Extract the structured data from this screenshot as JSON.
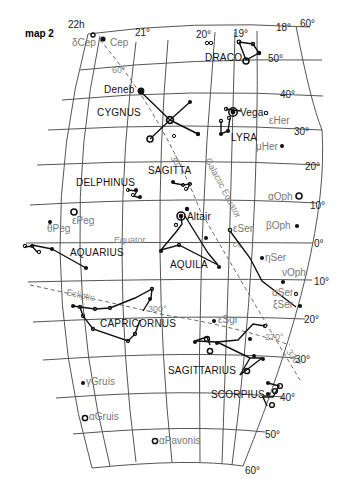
{
  "title": "map 2",
  "ra_labels": [
    {
      "text": "22h",
      "x": 64,
      "y": 32,
      "rot": -8
    },
    {
      "text": "21°",
      "x": 135,
      "y": 36,
      "rot": 0
    },
    {
      "text": "20°",
      "x": 198,
      "y": 38,
      "rot": 0
    },
    {
      "text": "19°",
      "x": 243,
      "y": 36,
      "rot": 0
    },
    {
      "text": "18°",
      "x": 283,
      "y": 30,
      "rot": 0
    },
    {
      "text": "60°",
      "x": 320,
      "y": 28,
      "rot": -20
    }
  ],
  "dec_labels": [
    {
      "text": "50°",
      "x": 325,
      "y": 62
    },
    {
      "text": "40°",
      "x": 321,
      "y": 98
    },
    {
      "text": "30°",
      "x": 318,
      "y": 135
    },
    {
      "text": "20°",
      "x": 312,
      "y": 170
    },
    {
      "text": "10°",
      "x": 310,
      "y": 209
    },
    {
      "text": "0°",
      "x": 313,
      "y": 247
    },
    {
      "text": "10°",
      "x": 313,
      "y": 285
    },
    {
      "text": "20°",
      "x": 304,
      "y": 323
    },
    {
      "text": "30°",
      "x": 295,
      "y": 364
    },
    {
      "text": "40°",
      "x": 283,
      "y": 402
    },
    {
      "text": "50°",
      "x": 265,
      "y": 438
    },
    {
      "text": "60°",
      "x": 242,
      "y": 472
    }
  ],
  "constellations": [
    {
      "name": "DRACO",
      "x": 205,
      "y": 61
    },
    {
      "name": "CYGNUS",
      "x": 97,
      "y": 116
    },
    {
      "name": "LYRA",
      "x": 231,
      "y": 141
    },
    {
      "name": "SAGITTA",
      "x": 152,
      "y": 174
    },
    {
      "name": "DELPHINUS",
      "x": 76,
      "y": 186
    },
    {
      "name": "AQUARIUS",
      "x": 40,
      "y": 255
    },
    {
      "name": "AQUILA",
      "x": 178,
      "y": 268
    },
    {
      "name": "CAPRICORNUS",
      "x": 99,
      "y": 327
    },
    {
      "name": "SAGITTARIUS",
      "x": 175,
      "y": 374
    },
    {
      "name": "SCORPIUS",
      "x": 211,
      "y": 398
    }
  ],
  "named_stars": [
    {
      "name": "δCep",
      "x": 72,
      "y": 46
    },
    {
      "name": "Cep",
      "x": 110,
      "y": 46
    },
    {
      "name": "Deneb",
      "x": 106,
      "y": 94
    },
    {
      "name": "Vega",
      "x": 237,
      "y": 113
    },
    {
      "name": "εHer",
      "x": 275,
      "y": 123
    },
    {
      "name": "μHer",
      "x": 253,
      "y": 151
    },
    {
      "name": "Altair",
      "x": 184,
      "y": 221
    },
    {
      "name": "εPeg",
      "x": 72,
      "y": 224
    },
    {
      "name": "θPeg",
      "x": 45,
      "y": 232
    },
    {
      "name": "αOph",
      "x": 270,
      "y": 200
    },
    {
      "name": "βOph",
      "x": 268,
      "y": 228
    },
    {
      "name": "εSer",
      "x": 236,
      "y": 230
    },
    {
      "name": "ηSer",
      "x": 262,
      "y": 258
    },
    {
      "name": "νOph",
      "x": 282,
      "y": 276
    },
    {
      "name": "αSer",
      "x": 274,
      "y": 296
    },
    {
      "name": "ξSer",
      "x": 276,
      "y": 306
    },
    {
      "name": "εSgr",
      "x": 218,
      "y": 323
    },
    {
      "name": "γGruis",
      "x": 88,
      "y": 383
    },
    {
      "name": "αGruis",
      "x": 92,
      "y": 417
    },
    {
      "name": "αPavonis",
      "x": 160,
      "y": 442
    }
  ],
  "lines": {
    "equator_label": "Equator",
    "ecliptic_label": "Ecliptic",
    "galactic_label": "Galactic Equator",
    "galactic_ticks": [
      "60°",
      "30°",
      "0°",
      "330°"
    ],
    "ecliptic_ticks": [
      "300°",
      "270°"
    ]
  }
}
